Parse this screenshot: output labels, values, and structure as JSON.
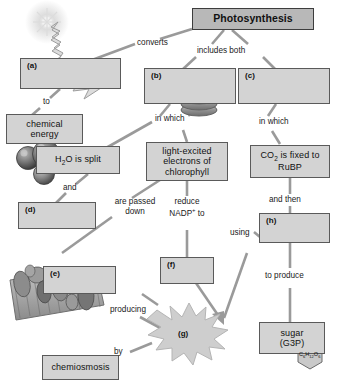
{
  "diagram": {
    "nodes": {
      "photosynthesis": "Photosynthesis",
      "a": "(a)",
      "b": "(b)",
      "c": "(c)",
      "chemical_energy": "chemical\nenergy",
      "h2o_split": "H2O is split",
      "light_excited": "light-excited\nelectrons of\nchlorophyll",
      "co2_fixed": "CO2 is fixed to\nRuBP",
      "d": "(d)",
      "e": "(e)",
      "f": "(f)",
      "g": "(g)",
      "h": "(h)",
      "chemiosmosis": "chemiosmosis",
      "sugar": "sugar\n(G3P)",
      "sugar_formula": "C6H12O6"
    },
    "edge_labels": {
      "converts": "converts",
      "includes_both": "includes both",
      "to": "to",
      "in_which_left": "in which",
      "in_which_right": "in which",
      "and": "and",
      "and_then": "and then",
      "are_passed_down": "are passed\ndown",
      "reduce_nadp_to": "reduce\nNADP+ to",
      "using": "using",
      "to_produce": "to produce",
      "producing": "producing",
      "by": "by"
    },
    "icons": {
      "sun": "sun-icon",
      "light_ray": "zigzag-light-arrow-icon",
      "granum": "thylakoid-stack-icon",
      "water_molecule": "water-molecule-ball-model-icon",
      "membrane": "thylakoid-membrane-icon",
      "star_burst": "starburst-icon",
      "glucose_hexagon": "glucose-hexagon-icon"
    },
    "colors": {
      "box_fill": "#d3d3d3",
      "box_stroke": "#5a5a5a",
      "title_fill": "#b8b8b8",
      "connector": "#8c8c8c",
      "background": "#ffffff",
      "text": "#111111"
    }
  }
}
